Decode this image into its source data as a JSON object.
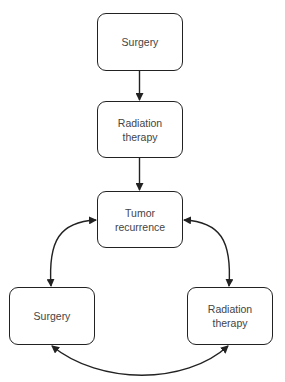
{
  "diagram": {
    "type": "flowchart",
    "nodes": [
      {
        "id": "surgery_top",
        "label": "Surgery"
      },
      {
        "id": "radiation_mid",
        "label": "Radiation therapy"
      },
      {
        "id": "tumor",
        "label": "Tumor recurrence"
      },
      {
        "id": "surgery_bottom",
        "label": "Surgery"
      },
      {
        "id": "radiation_bottom",
        "label": "Radiation therapy"
      }
    ],
    "edges": [
      {
        "from": "surgery_top",
        "to": "radiation_mid",
        "direction": "forward"
      },
      {
        "from": "radiation_mid",
        "to": "tumor",
        "direction": "forward"
      },
      {
        "from": "tumor",
        "to": "surgery_bottom",
        "direction": "bidirectional"
      },
      {
        "from": "tumor",
        "to": "radiation_bottom",
        "direction": "bidirectional"
      },
      {
        "from": "surgery_bottom",
        "to": "radiation_bottom",
        "direction": "bidirectional"
      }
    ],
    "colors": {
      "stroke": "#222222",
      "text": "#444444",
      "background": "#ffffff"
    }
  }
}
